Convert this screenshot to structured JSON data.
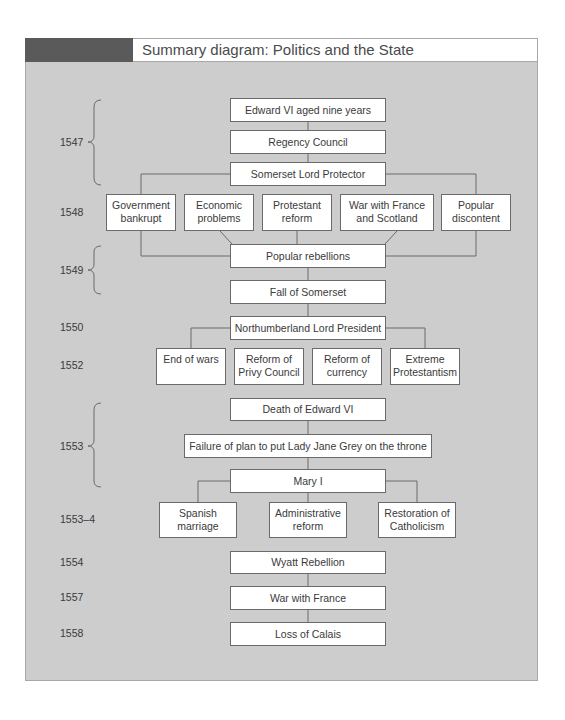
{
  "title": "Summary diagram: Politics and the State",
  "colors": {
    "panel_bg": "#cdcdcd",
    "header_dark": "#5a5a5a",
    "box_bg": "#ffffff",
    "line": "#6a6a6a"
  },
  "years": {
    "y1547": "1547",
    "y1548": "1548",
    "y1549": "1549",
    "y1550": "1550",
    "y1552": "1552",
    "y1553": "1553",
    "y1553_4": "1553–4",
    "y1554": "1554",
    "y1557": "1557",
    "y1558": "1558"
  },
  "nodes": {
    "edward_vi": "Edward VI aged nine years",
    "regency_council": "Regency Council",
    "somerset": "Somerset Lord Protector",
    "gov_bankrupt": "Government\nbankrupt",
    "economic_problems": "Economic\nproblems",
    "protestant_reform": "Protestant\nreform",
    "war_france_scotland": "War with France\nand Scotland",
    "popular_discontent": "Popular\ndiscontent",
    "popular_rebellions": "Popular rebellions",
    "fall_somerset": "Fall of Somerset",
    "northumberland": "Northumberland Lord President",
    "end_of_wars": "End of wars",
    "reform_privy_council": "Reform of\nPrivy Council",
    "reform_currency": "Reform of\ncurrency",
    "extreme_protestantism": "Extreme\nProtestantism",
    "death_edward": "Death of Edward VI",
    "failure_jane_grey": "Failure of plan to put Lady Jane Grey on the throne",
    "mary_i": "Mary I",
    "spanish_marriage": "Spanish\nmarriage",
    "administrative_reform": "Administrative\nreform",
    "restoration_catholicism": "Restoration of\nCatholicism",
    "wyatt_rebellion": "Wyatt Rebellion",
    "war_with_france": "War with France",
    "loss_of_calais": "Loss of Calais"
  }
}
